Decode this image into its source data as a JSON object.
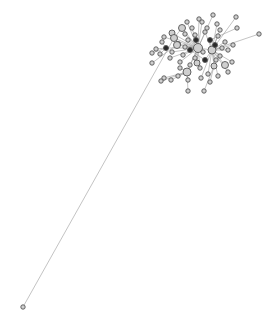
{
  "graph": {
    "type": "network",
    "background": "#ffffff",
    "edge_color": "#9a9a9a",
    "node_fill": "#cfcfcf",
    "node_fill_dark": "#2a2a2a",
    "node_stroke": "#555555",
    "hub": {
      "x": 200,
      "y": 45
    },
    "nodes": [
      {
        "id": 0,
        "x": 23,
        "y": 307,
        "r": 2.2,
        "fill": "#cfcfcf"
      },
      {
        "id": 1,
        "x": 259,
        "y": 34,
        "r": 2.2,
        "fill": "#cfcfcf"
      },
      {
        "id": 2,
        "x": 213,
        "y": 15,
        "r": 2.2,
        "fill": "#cfcfcf"
      },
      {
        "id": 3,
        "x": 236,
        "y": 17,
        "r": 2.2,
        "fill": "#cfcfcf"
      },
      {
        "id": 4,
        "x": 237,
        "y": 28,
        "r": 2.2,
        "fill": "#cfcfcf"
      },
      {
        "id": 5,
        "x": 199,
        "y": 19,
        "r": 2.2,
        "fill": "#cfcfcf"
      },
      {
        "id": 6,
        "x": 187,
        "y": 22,
        "r": 2.2,
        "fill": "#cfcfcf"
      },
      {
        "id": 7,
        "x": 202,
        "y": 22,
        "r": 2.2,
        "fill": "#cfcfcf"
      },
      {
        "id": 8,
        "x": 217,
        "y": 24,
        "r": 2.2,
        "fill": "#cfcfcf"
      },
      {
        "id": 9,
        "x": 182,
        "y": 28,
        "r": 3.5,
        "fill": "#cfcfcf"
      },
      {
        "id": 10,
        "x": 172,
        "y": 33,
        "r": 3.0,
        "fill": "#cfcfcf"
      },
      {
        "id": 11,
        "x": 164,
        "y": 37,
        "r": 2.2,
        "fill": "#cfcfcf"
      },
      {
        "id": 12,
        "x": 174,
        "y": 38,
        "r": 3.5,
        "fill": "#cfcfcf"
      },
      {
        "id": 13,
        "x": 156,
        "y": 49,
        "r": 2.2,
        "fill": "#cfcfcf"
      },
      {
        "id": 14,
        "x": 160,
        "y": 54,
        "r": 2.2,
        "fill": "#cfcfcf"
      },
      {
        "id": 15,
        "x": 152,
        "y": 63,
        "r": 2.2,
        "fill": "#cfcfcf"
      },
      {
        "id": 16,
        "x": 166,
        "y": 48,
        "r": 2.5,
        "fill": "#2a2a2a"
      },
      {
        "id": 17,
        "x": 178,
        "y": 44,
        "r": 2.5,
        "fill": "#2a2a2a"
      },
      {
        "id": 18,
        "x": 188,
        "y": 40,
        "r": 2.2,
        "fill": "#cfcfcf"
      },
      {
        "id": 19,
        "x": 195,
        "y": 35,
        "r": 2.2,
        "fill": "#cfcfcf"
      },
      {
        "id": 20,
        "x": 205,
        "y": 32,
        "r": 2.2,
        "fill": "#cfcfcf"
      },
      {
        "id": 21,
        "x": 210,
        "y": 40,
        "r": 2.5,
        "fill": "#2a2a2a"
      },
      {
        "id": 22,
        "x": 218,
        "y": 36,
        "r": 2.2,
        "fill": "#cfcfcf"
      },
      {
        "id": 23,
        "x": 225,
        "y": 42,
        "r": 2.2,
        "fill": "#cfcfcf"
      },
      {
        "id": 24,
        "x": 198,
        "y": 48,
        "r": 4.5,
        "fill": "#cfcfcf"
      },
      {
        "id": 25,
        "x": 212,
        "y": 50,
        "r": 4.0,
        "fill": "#cfcfcf"
      },
      {
        "id": 26,
        "x": 190,
        "y": 50,
        "r": 2.5,
        "fill": "#2a2a2a"
      },
      {
        "id": 27,
        "x": 183,
        "y": 55,
        "r": 2.2,
        "fill": "#cfcfcf"
      },
      {
        "id": 28,
        "x": 195,
        "y": 58,
        "r": 2.2,
        "fill": "#cfcfcf"
      },
      {
        "id": 29,
        "x": 205,
        "y": 60,
        "r": 2.5,
        "fill": "#2a2a2a"
      },
      {
        "id": 30,
        "x": 220,
        "y": 56,
        "r": 2.2,
        "fill": "#cfcfcf"
      },
      {
        "id": 31,
        "x": 228,
        "y": 50,
        "r": 2.2,
        "fill": "#cfcfcf"
      },
      {
        "id": 32,
        "x": 232,
        "y": 62,
        "r": 2.2,
        "fill": "#cfcfcf"
      },
      {
        "id": 33,
        "x": 225,
        "y": 65,
        "r": 3.5,
        "fill": "#cfcfcf"
      },
      {
        "id": 34,
        "x": 214,
        "y": 66,
        "r": 3.0,
        "fill": "#cfcfcf"
      },
      {
        "id": 35,
        "x": 200,
        "y": 68,
        "r": 2.2,
        "fill": "#cfcfcf"
      },
      {
        "id": 36,
        "x": 190,
        "y": 65,
        "r": 2.2,
        "fill": "#cfcfcf"
      },
      {
        "id": 37,
        "x": 180,
        "y": 62,
        "r": 2.2,
        "fill": "#cfcfcf"
      },
      {
        "id": 38,
        "x": 170,
        "y": 58,
        "r": 2.2,
        "fill": "#cfcfcf"
      },
      {
        "id": 39,
        "x": 187,
        "y": 72,
        "r": 4.0,
        "fill": "#cfcfcf"
      },
      {
        "id": 40,
        "x": 208,
        "y": 74,
        "r": 2.2,
        "fill": "#cfcfcf"
      },
      {
        "id": 41,
        "x": 218,
        "y": 76,
        "r": 2.2,
        "fill": "#cfcfcf"
      },
      {
        "id": 42,
        "x": 228,
        "y": 72,
        "r": 2.2,
        "fill": "#cfcfcf"
      },
      {
        "id": 43,
        "x": 178,
        "y": 76,
        "r": 2.2,
        "fill": "#cfcfcf"
      },
      {
        "id": 44,
        "x": 188,
        "y": 80,
        "r": 2.2,
        "fill": "#cfcfcf"
      },
      {
        "id": 45,
        "x": 201,
        "y": 78,
        "r": 2.2,
        "fill": "#cfcfcf"
      },
      {
        "id": 46,
        "x": 171,
        "y": 80,
        "r": 2.2,
        "fill": "#cfcfcf"
      },
      {
        "id": 47,
        "x": 164,
        "y": 78,
        "r": 2.2,
        "fill": "#cfcfcf"
      },
      {
        "id": 48,
        "x": 161,
        "y": 81,
        "r": 2.2,
        "fill": "#cfcfcf"
      },
      {
        "id": 49,
        "x": 188,
        "y": 91,
        "r": 2.2,
        "fill": "#cfcfcf"
      },
      {
        "id": 50,
        "x": 204,
        "y": 91,
        "r": 2.2,
        "fill": "#cfcfcf"
      },
      {
        "id": 51,
        "x": 177,
        "y": 45,
        "r": 3.5,
        "fill": "#cfcfcf"
      },
      {
        "id": 52,
        "x": 215,
        "y": 45,
        "r": 2.5,
        "fill": "#2a2a2a"
      },
      {
        "id": 53,
        "x": 220,
        "y": 30,
        "r": 2.2,
        "fill": "#cfcfcf"
      },
      {
        "id": 54,
        "x": 207,
        "y": 28,
        "r": 2.2,
        "fill": "#cfcfcf"
      },
      {
        "id": 55,
        "x": 192,
        "y": 28,
        "r": 2.2,
        "fill": "#cfcfcf"
      },
      {
        "id": 56,
        "x": 185,
        "y": 34,
        "r": 2.2,
        "fill": "#cfcfcf"
      },
      {
        "id": 57,
        "x": 162,
        "y": 42,
        "r": 2.2,
        "fill": "#cfcfcf"
      },
      {
        "id": 58,
        "x": 152,
        "y": 53,
        "r": 2.2,
        "fill": "#cfcfcf"
      },
      {
        "id": 59,
        "x": 222,
        "y": 48,
        "r": 2.2,
        "fill": "#cfcfcf"
      },
      {
        "id": 60,
        "x": 233,
        "y": 45,
        "r": 2.2,
        "fill": "#cfcfcf"
      },
      {
        "id": 61,
        "x": 196,
        "y": 40,
        "r": 2.5,
        "fill": "#2a2a2a"
      },
      {
        "id": 62,
        "x": 203,
        "y": 52,
        "r": 2.2,
        "fill": "#cfcfcf"
      },
      {
        "id": 63,
        "x": 185,
        "y": 47,
        "r": 2.2,
        "fill": "#cfcfcf"
      },
      {
        "id": 64,
        "x": 172,
        "y": 52,
        "r": 2.2,
        "fill": "#cfcfcf"
      },
      {
        "id": 65,
        "x": 210,
        "y": 82,
        "r": 2.2,
        "fill": "#cfcfcf"
      },
      {
        "id": 66,
        "x": 197,
        "y": 63,
        "r": 3.0,
        "fill": "#cfcfcf"
      },
      {
        "id": 67,
        "x": 180,
        "y": 68,
        "r": 2.2,
        "fill": "#cfcfcf"
      },
      {
        "id": 68,
        "x": 216,
        "y": 60,
        "r": 2.2,
        "fill": "#cfcfcf"
      }
    ],
    "edges": [
      [
        0,
        12
      ],
      [
        1,
        25
      ],
      [
        2,
        24
      ],
      [
        3,
        25
      ],
      [
        4,
        21
      ],
      [
        5,
        24
      ],
      [
        6,
        24
      ],
      [
        7,
        24
      ],
      [
        8,
        25
      ],
      [
        9,
        24
      ],
      [
        10,
        24
      ],
      [
        11,
        24
      ],
      [
        12,
        24
      ],
      [
        13,
        16
      ],
      [
        14,
        16
      ],
      [
        15,
        17
      ],
      [
        16,
        24
      ],
      [
        17,
        24
      ],
      [
        18,
        24
      ],
      [
        19,
        24
      ],
      [
        20,
        25
      ],
      [
        21,
        25
      ],
      [
        22,
        25
      ],
      [
        23,
        25
      ],
      [
        24,
        25
      ],
      [
        26,
        24
      ],
      [
        27,
        24
      ],
      [
        28,
        24
      ],
      [
        29,
        25
      ],
      [
        30,
        25
      ],
      [
        31,
        25
      ],
      [
        32,
        25
      ],
      [
        33,
        25
      ],
      [
        34,
        25
      ],
      [
        35,
        24
      ],
      [
        36,
        24
      ],
      [
        37,
        24
      ],
      [
        38,
        24
      ],
      [
        39,
        24
      ],
      [
        40,
        25
      ],
      [
        41,
        25
      ],
      [
        42,
        25
      ],
      [
        43,
        39
      ],
      [
        44,
        39
      ],
      [
        45,
        25
      ],
      [
        46,
        39
      ],
      [
        47,
        39
      ],
      [
        48,
        39
      ],
      [
        49,
        39
      ],
      [
        50,
        34
      ],
      [
        51,
        24
      ],
      [
        52,
        25
      ],
      [
        53,
        25
      ],
      [
        54,
        24
      ],
      [
        55,
        24
      ],
      [
        56,
        24
      ],
      [
        57,
        16
      ],
      [
        58,
        16
      ],
      [
        59,
        25
      ],
      [
        60,
        25
      ],
      [
        61,
        24
      ],
      [
        62,
        24
      ],
      [
        63,
        24
      ],
      [
        64,
        24
      ],
      [
        65,
        34
      ],
      [
        66,
        24
      ],
      [
        67,
        39
      ],
      [
        68,
        25
      ],
      [
        9,
        12
      ],
      [
        21,
        52
      ],
      [
        26,
        29
      ],
      [
        17,
        51
      ]
    ]
  }
}
